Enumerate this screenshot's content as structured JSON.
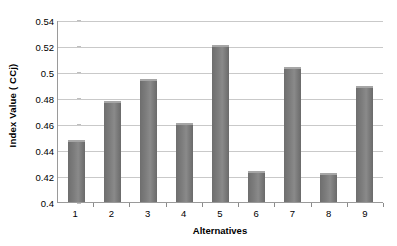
{
  "chart_data": {
    "type": "bar",
    "title": "",
    "xlabel": "Alternatives",
    "ylabel": "Index Value ( CCj)",
    "categories": [
      "1",
      "2",
      "3",
      "4",
      "5",
      "6",
      "7",
      "8",
      "9"
    ],
    "values": [
      0.448,
      0.478,
      0.495,
      0.461,
      0.521,
      0.424,
      0.504,
      0.422,
      0.489
    ],
    "ylim": [
      0.4,
      0.54
    ],
    "yticks": [
      0.4,
      0.42,
      0.44,
      0.46,
      0.48,
      0.5,
      0.52,
      0.54
    ],
    "ytick_labels": [
      "0.4",
      "0.42",
      "0.44",
      "0.46",
      "0.48",
      "0.5",
      "0.52",
      "0.54"
    ],
    "grid": "horizontal",
    "legend": "none",
    "series": [
      {
        "name": "CCj",
        "values": [
          0.448,
          0.478,
          0.495,
          0.461,
          0.521,
          0.424,
          0.504,
          0.422,
          0.489
        ]
      }
    ],
    "colors": {
      "bar_fill": "#7a7a7a",
      "bar_highlight": "#a6a6a6",
      "gridline": "#c9c9c9",
      "axis": "#9a9a9a",
      "text": "#000000",
      "background": "#ffffff"
    }
  }
}
